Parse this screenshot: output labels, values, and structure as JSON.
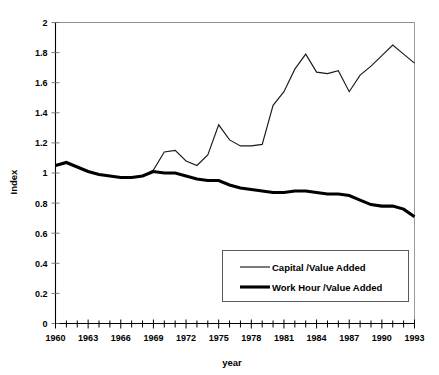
{
  "chart_data": {
    "type": "line",
    "title": "",
    "xlabel": "year",
    "ylabel": "Index",
    "xlim": [
      1960,
      1993
    ],
    "ylim": [
      0,
      2
    ],
    "grid": false,
    "legend_position": "bottom-right",
    "y_ticks": [
      "0",
      "0.2",
      "0.4",
      "0.6",
      "0.8",
      "1",
      "1.2",
      "1.4",
      "1.6",
      "1.8",
      "2"
    ],
    "y_tick_values": [
      0,
      0.2,
      0.4,
      0.6,
      0.8,
      1.0,
      1.2,
      1.4,
      1.6,
      1.8,
      2.0
    ],
    "x_ticks": [
      "1960",
      "1963",
      "1966",
      "1969",
      "1972",
      "1975",
      "1978",
      "1981",
      "1984",
      "1987",
      "1990",
      "1993"
    ],
    "x_tick_values": [
      1960,
      1963,
      1966,
      1969,
      1972,
      1975,
      1978,
      1981,
      1984,
      1987,
      1990,
      1993
    ],
    "x_minor_tick_interval": 1,
    "x": [
      1960,
      1961,
      1962,
      1963,
      1964,
      1965,
      1966,
      1967,
      1968,
      1969,
      1970,
      1971,
      1972,
      1973,
      1974,
      1975,
      1976,
      1977,
      1978,
      1979,
      1980,
      1981,
      1982,
      1983,
      1984,
      1985,
      1986,
      1987,
      1988,
      1989,
      1990,
      1991,
      1992,
      1993
    ],
    "series": [
      {
        "name": "Capital /Value Added",
        "style": "thin",
        "color": "#1a1a1a",
        "values": [
          1.05,
          1.07,
          1.04,
          1.01,
          0.99,
          0.98,
          0.97,
          0.97,
          0.98,
          1.02,
          1.14,
          1.15,
          1.08,
          1.05,
          1.12,
          1.32,
          1.22,
          1.18,
          1.18,
          1.19,
          1.45,
          1.54,
          1.69,
          1.79,
          1.67,
          1.66,
          1.68,
          1.54,
          1.65,
          1.71,
          1.78,
          1.85,
          1.79,
          1.73
        ]
      },
      {
        "name": "Work Hour /Value Added",
        "style": "thick",
        "color": "#000000",
        "values": [
          1.05,
          1.07,
          1.04,
          1.01,
          0.99,
          0.98,
          0.97,
          0.97,
          0.98,
          1.01,
          1.0,
          1.0,
          0.98,
          0.96,
          0.95,
          0.95,
          0.92,
          0.9,
          0.89,
          0.88,
          0.87,
          0.87,
          0.88,
          0.88,
          0.87,
          0.86,
          0.86,
          0.85,
          0.82,
          0.79,
          0.78,
          0.78,
          0.76,
          0.71
        ]
      }
    ]
  },
  "legend": {
    "entries": [
      {
        "label": "Capital /Value Added"
      },
      {
        "label": "Work Hour /Value Added"
      }
    ]
  },
  "axes": {
    "y_title": "Index",
    "x_title": "year"
  }
}
